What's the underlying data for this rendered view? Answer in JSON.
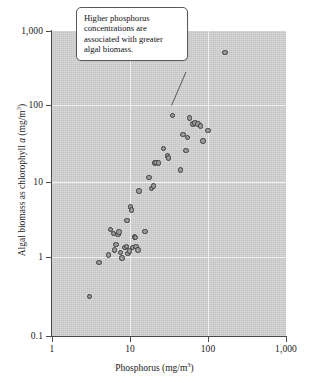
{
  "chart_data": {
    "type": "scatter",
    "title": "",
    "xlabel": "Phosphorus (mg/m3)",
    "ylabel": "Algal biomass as chlorophyll a (mg/m3)",
    "xscale": "log",
    "yscale": "log",
    "xlim": [
      1,
      1000
    ],
    "ylim": [
      0.1,
      1000
    ],
    "grid": true,
    "legend": null,
    "xticklabels": [
      "1",
      "10",
      "100",
      "1,000"
    ],
    "xtickvalues": [
      1,
      10,
      100,
      1000
    ],
    "yticklabels": [
      "1,000",
      "100",
      "10",
      "1",
      "0.1"
    ],
    "ytickvalues": [
      1000,
      100,
      10,
      1,
      0.1
    ],
    "annotations": [
      {
        "text": "Higher phosphorus concentrations are associated with greater algal biomass.",
        "points_to_x": 35,
        "points_to_y": 78
      }
    ],
    "points": [
      {
        "x": 3.0,
        "y": 0.33
      },
      {
        "x": 4.0,
        "y": 0.92
      },
      {
        "x": 5.3,
        "y": 1.15
      },
      {
        "x": 5.6,
        "y": 2.5
      },
      {
        "x": 6.1,
        "y": 2.2
      },
      {
        "x": 6.3,
        "y": 1.35
      },
      {
        "x": 6.6,
        "y": 1.6
      },
      {
        "x": 7.0,
        "y": 2.15
      },
      {
        "x": 7.2,
        "y": 2.3
      },
      {
        "x": 7.6,
        "y": 1.25
      },
      {
        "x": 7.9,
        "y": 1.05
      },
      {
        "x": 8.6,
        "y": 1.45
      },
      {
        "x": 9.0,
        "y": 1.5
      },
      {
        "x": 9.2,
        "y": 3.3
      },
      {
        "x": 9.4,
        "y": 1.2
      },
      {
        "x": 9.8,
        "y": 1.3
      },
      {
        "x": 10.2,
        "y": 4.9
      },
      {
        "x": 10.4,
        "y": 4.5
      },
      {
        "x": 10.8,
        "y": 1.45
      },
      {
        "x": 11.4,
        "y": 2.0
      },
      {
        "x": 11.8,
        "y": 1.95
      },
      {
        "x": 12.0,
        "y": 1.5
      },
      {
        "x": 12.6,
        "y": 1.35
      },
      {
        "x": 13.0,
        "y": 8.0
      },
      {
        "x": 15.5,
        "y": 2.35
      },
      {
        "x": 17.5,
        "y": 12.0
      },
      {
        "x": 19.0,
        "y": 8.6
      },
      {
        "x": 20.0,
        "y": 9.3
      },
      {
        "x": 21.0,
        "y": 18.5
      },
      {
        "x": 21.5,
        "y": 19.0
      },
      {
        "x": 23.0,
        "y": 18.6
      },
      {
        "x": 27.0,
        "y": 29.0
      },
      {
        "x": 30.0,
        "y": 23.0
      },
      {
        "x": 31.0,
        "y": 21.5
      },
      {
        "x": 35.0,
        "y": 78.0
      },
      {
        "x": 44.0,
        "y": 15.0
      },
      {
        "x": 48.0,
        "y": 44.0
      },
      {
        "x": 52.0,
        "y": 27.0
      },
      {
        "x": 55.0,
        "y": 40.0
      },
      {
        "x": 58.0,
        "y": 72.0
      },
      {
        "x": 64.0,
        "y": 60.0
      },
      {
        "x": 68.0,
        "y": 62.0
      },
      {
        "x": 74.0,
        "y": 60.0
      },
      {
        "x": 80.0,
        "y": 57.0
      },
      {
        "x": 86.0,
        "y": 36.0
      },
      {
        "x": 100.0,
        "y": 50.0
      },
      {
        "x": 165.0,
        "y": 520.0
      }
    ]
  }
}
